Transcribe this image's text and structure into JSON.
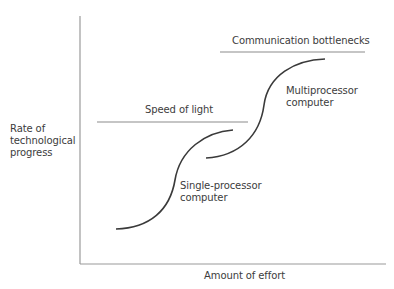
{
  "diagram": {
    "axes": {
      "y_label_lines": [
        "Rate of",
        "technological",
        "progress"
      ],
      "x_label": "Amount of effort"
    },
    "limits": [
      {
        "label": "Speed of light"
      },
      {
        "label": "Communication bottlenecks"
      }
    ],
    "curves": [
      {
        "label_lines": [
          "Single-processor",
          "computer"
        ]
      },
      {
        "label_lines": [
          "Multiprocessor",
          "computer"
        ]
      }
    ],
    "colors": {
      "axis": "#9a9a9a",
      "limit_line": "#8c8c8c",
      "curve": "#3a3a3a",
      "text": "#3c3c3c"
    }
  }
}
